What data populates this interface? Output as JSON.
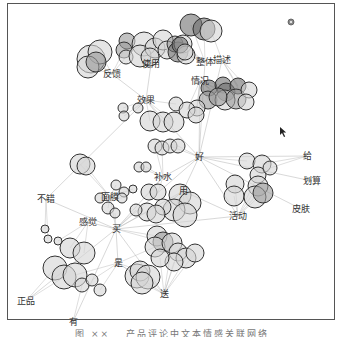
{
  "figure": {
    "caption": "图 ×× 　产品评论中文本情感关联网络",
    "colors": {
      "node_fill_light": "#d4d4d4",
      "node_fill_mid": "#9a9a9a",
      "node_fill_dark": "#6f6f6f",
      "node_stroke": "#333333",
      "edge": "#bdbdbd",
      "label": "#333333",
      "frame": "#555555"
    },
    "hubs": [
      {
        "id": "fankui",
        "label": "反馈",
        "x": 112,
        "y": 74
      },
      {
        "id": "shiyong",
        "label": "使用",
        "x": 151,
        "y": 64
      },
      {
        "id": "zhengti",
        "label": "整体",
        "x": 205,
        "y": 62
      },
      {
        "id": "miaoshu",
        "label": "描述",
        "x": 222,
        "y": 60
      },
      {
        "id": "qingkuang",
        "label": "情况",
        "x": 200,
        "y": 81
      },
      {
        "id": "xiaoguo",
        "label": "效果",
        "x": 146,
        "y": 100
      },
      {
        "id": "hao",
        "label": "好",
        "x": 199,
        "y": 157
      },
      {
        "id": "bushui",
        "label": "补水",
        "x": 163,
        "y": 177
      },
      {
        "id": "yong",
        "label": "用",
        "x": 183,
        "y": 191
      },
      {
        "id": "huodong",
        "label": "活动",
        "x": 238,
        "y": 216
      },
      {
        "id": "gei",
        "label": "给",
        "x": 307,
        "y": 156
      },
      {
        "id": "huasuan",
        "label": "划算",
        "x": 312,
        "y": 181
      },
      {
        "id": "pifu",
        "label": "皮肤",
        "x": 301,
        "y": 209
      },
      {
        "id": "bucuo",
        "label": "不错",
        "x": 46,
        "y": 199
      },
      {
        "id": "mianmo",
        "label": "面膜",
        "x": 110,
        "y": 197
      },
      {
        "id": "ganjue",
        "label": "感觉",
        "x": 88,
        "y": 222
      },
      {
        "id": "mai",
        "label": "买",
        "x": 116,
        "y": 229
      },
      {
        "id": "shi",
        "label": "是",
        "x": 118,
        "y": 263
      },
      {
        "id": "song",
        "label": "送",
        "x": 164,
        "y": 294
      },
      {
        "id": "zhengpin",
        "label": "正品",
        "x": 26,
        "y": 301
      },
      {
        "id": "you",
        "label": "有",
        "x": 73,
        "y": 322
      }
    ],
    "clusters": [
      {
        "id": "c1",
        "circles": [
          [
            91,
            59,
            14,
            "l"
          ],
          [
            100,
            52,
            12,
            "l"
          ],
          [
            88,
            67,
            11,
            "l"
          ],
          [
            96,
            62,
            10,
            "m"
          ]
        ]
      },
      {
        "id": "c2",
        "circles": [
          [
            127,
            41,
            8,
            "m"
          ],
          [
            124,
            50,
            8,
            "m"
          ],
          [
            126,
            57,
            7,
            "l"
          ],
          [
            144,
            44,
            12,
            "l"
          ],
          [
            140,
            56,
            11,
            "l"
          ],
          [
            155,
            48,
            10,
            "l"
          ],
          [
            150,
            57,
            9,
            "l"
          ],
          [
            163,
            40,
            10,
            "l"
          ],
          [
            167,
            50,
            9,
            "l"
          ],
          [
            175,
            44,
            8,
            "m"
          ],
          [
            178,
            52,
            10,
            "d"
          ],
          [
            183,
            44,
            9,
            "l"
          ],
          [
            186,
            55,
            9,
            "l"
          ]
        ]
      },
      {
        "id": "c3",
        "circles": [
          [
            191,
            25,
            11,
            "d"
          ],
          [
            204,
            29,
            11,
            "d"
          ],
          [
            211,
            31,
            11,
            "l"
          ],
          [
            180,
            45,
            8,
            "d"
          ],
          [
            185,
            52,
            8,
            "l"
          ]
        ]
      },
      {
        "id": "c4",
        "circles": [
          [
            209,
            88,
            8,
            "d"
          ],
          [
            208,
            100,
            9,
            "m"
          ],
          [
            223,
            85,
            8,
            "d"
          ],
          [
            226,
            92,
            9,
            "d"
          ],
          [
            225,
            100,
            10,
            "l"
          ],
          [
            238,
            86,
            8,
            "d"
          ],
          [
            236,
            99,
            10,
            "m"
          ],
          [
            249,
            90,
            8,
            "l"
          ],
          [
            246,
            102,
            8,
            "l"
          ],
          [
            218,
            97,
            9,
            "m"
          ],
          [
            197,
            108,
            8,
            "l"
          ]
        ]
      },
      {
        "id": "c5",
        "circles": [
          [
            123,
            108,
            5,
            "l"
          ],
          [
            124,
            116,
            5,
            "l"
          ],
          [
            138,
            108,
            5,
            "l"
          ],
          [
            150,
            121,
            10,
            "l"
          ],
          [
            163,
            122,
            10,
            "l"
          ],
          [
            174,
            122,
            10,
            "l"
          ],
          [
            176,
            104,
            7,
            "l"
          ],
          [
            187,
            110,
            8,
            "l"
          ],
          [
            196,
            115,
            8,
            "l"
          ]
        ]
      },
      {
        "id": "c6",
        "circles": [
          [
            155,
            146,
            7,
            "l"
          ],
          [
            162,
            148,
            7,
            "l"
          ],
          [
            170,
            146,
            7,
            "l"
          ],
          [
            178,
            146,
            7,
            "l"
          ],
          [
            139,
            167,
            5,
            "l"
          ],
          [
            146,
            167,
            5,
            "l"
          ]
        ]
      },
      {
        "id": "c7",
        "circles": [
          [
            80,
            164,
            10,
            "l"
          ],
          [
            86,
            166,
            9,
            "l"
          ]
        ]
      },
      {
        "id": "c8",
        "circles": [
          [
            247,
            161,
            8,
            "l"
          ],
          [
            262,
            164,
            9,
            "l"
          ],
          [
            258,
            175,
            8,
            "l"
          ],
          [
            270,
            168,
            7,
            "l"
          ],
          [
            235,
            184,
            9,
            "l"
          ],
          [
            234,
            196,
            10,
            "l"
          ],
          [
            258,
            186,
            10,
            "l"
          ],
          [
            255,
            197,
            11,
            "l"
          ],
          [
            263,
            193,
            10,
            "m"
          ]
        ]
      },
      {
        "id": "c9",
        "circles": [
          [
            180,
            195,
            11,
            "l"
          ],
          [
            190,
            203,
            11,
            "l"
          ],
          [
            174,
            210,
            11,
            "l"
          ],
          [
            185,
            215,
            12,
            "l"
          ],
          [
            163,
            207,
            8,
            "l"
          ]
        ]
      },
      {
        "id": "c10",
        "circles": [
          [
            116,
            185,
            5,
            "l"
          ],
          [
            124,
            192,
            5,
            "l"
          ],
          [
            122,
            198,
            5,
            "l"
          ],
          [
            133,
            189,
            4,
            "l"
          ],
          [
            149,
            192,
            8,
            "l"
          ],
          [
            158,
            192,
            8,
            "l"
          ],
          [
            147,
            212,
            9,
            "l"
          ],
          [
            156,
            214,
            9,
            "l"
          ],
          [
            136,
            210,
            6,
            "l"
          ]
        ]
      },
      {
        "id": "c11",
        "circles": [
          [
            157,
            236,
            10,
            "l"
          ],
          [
            163,
            242,
            10,
            "m"
          ],
          [
            155,
            247,
            10,
            "l"
          ],
          [
            172,
            243,
            10,
            "l"
          ],
          [
            178,
            252,
            9,
            "l"
          ],
          [
            186,
            258,
            10,
            "l"
          ],
          [
            195,
            253,
            9,
            "l"
          ],
          [
            174,
            262,
            9,
            "l"
          ],
          [
            160,
            258,
            9,
            "l"
          ]
        ]
      },
      {
        "id": "c12",
        "circles": [
          [
            137,
            276,
            12,
            "l"
          ],
          [
            140,
            271,
            10,
            "l"
          ],
          [
            148,
            277,
            12,
            "l"
          ],
          [
            142,
            283,
            11,
            "l"
          ]
        ]
      },
      {
        "id": "c13",
        "circles": [
          [
            45,
            229,
            4,
            "l"
          ],
          [
            48,
            239,
            4,
            "l"
          ],
          [
            58,
            241,
            4,
            "l"
          ],
          [
            70,
            248,
            10,
            "l"
          ],
          [
            84,
            253,
            11,
            "l"
          ],
          [
            55,
            268,
            12,
            "l"
          ],
          [
            64,
            277,
            12,
            "l"
          ],
          [
            75,
            275,
            12,
            "l"
          ],
          [
            82,
            285,
            7,
            "l"
          ],
          [
            92,
            280,
            6,
            "l"
          ],
          [
            100,
            290,
            6,
            "l"
          ]
        ]
      },
      {
        "id": "c14",
        "circles": [
          [
            100,
            198,
            5,
            "l"
          ],
          [
            108,
            208,
            6,
            "l"
          ],
          [
            115,
            213,
            5,
            "l"
          ]
        ]
      }
    ],
    "edges": [
      [
        "fankui",
        "xiaoguo"
      ],
      [
        "shiyong",
        "xiaoguo"
      ],
      [
        "zhengti",
        "hao"
      ],
      [
        "miaoshu",
        "hao"
      ],
      [
        "qingkuang",
        "hao"
      ],
      [
        "xiaoguo",
        "hao"
      ],
      [
        "hao",
        "gei"
      ],
      [
        "hao",
        "huasuan"
      ],
      [
        "hao",
        "pifu"
      ],
      [
        "hao",
        "huodong"
      ],
      [
        "hao",
        "bushui"
      ],
      [
        "hao",
        "yong"
      ],
      [
        "mai",
        "bucuo"
      ],
      [
        "mai",
        "ganjue"
      ],
      [
        "mai",
        "mianmo"
      ],
      [
        "mai",
        "zhengpin"
      ],
      [
        "mai",
        "you"
      ],
      [
        "mai",
        "shi"
      ],
      [
        "mai",
        "song"
      ],
      [
        "mai",
        "hao"
      ],
      [
        "mai",
        "yong"
      ],
      [
        "shi",
        "song"
      ],
      [
        "bucuo",
        "xiaoguo"
      ],
      [
        "yong",
        "huodong"
      ],
      [
        "bushui",
        "mai"
      ],
      [
        "mai",
        "huodong"
      ]
    ],
    "pointer": {
      "x": 280,
      "y": 127
    },
    "small_icon": {
      "x": 291,
      "y": 22
    }
  }
}
